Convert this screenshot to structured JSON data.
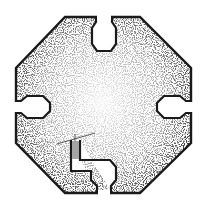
{
  "diagram": {
    "type": "octagonal floor plan",
    "colors": {
      "wall": "#1a1a1a",
      "stipple": "#2b2b2b",
      "background": "#ffffff"
    },
    "outline": [
      [
        65,
        17
      ],
      [
        140,
        17
      ],
      [
        191,
        68
      ],
      [
        191,
        143
      ],
      [
        140,
        193
      ],
      [
        65,
        193
      ],
      [
        16,
        143
      ],
      [
        16,
        68
      ]
    ],
    "niches": [
      {
        "id": "north",
        "label": "north-niche"
      },
      {
        "id": "east",
        "label": "east-niche"
      },
      {
        "id": "west",
        "label": "west-niche"
      },
      {
        "id": "south",
        "label": "south-passage"
      }
    ],
    "staircase": {
      "steps": 9
    }
  }
}
